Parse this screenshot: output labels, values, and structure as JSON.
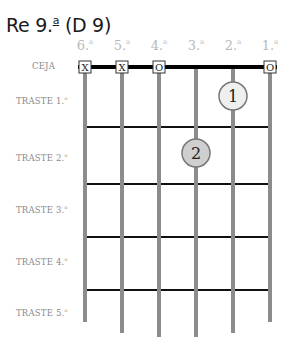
{
  "title": {
    "main": "Re 9.",
    "superscript": "a",
    "alt": "(D 9)"
  },
  "strings": [
    {
      "number": "6.",
      "sup": "a",
      "x": 85,
      "marker": "X",
      "bottom": 322
    },
    {
      "number": "5.",
      "sup": "a",
      "x": 122,
      "marker": "X",
      "bottom": 333
    },
    {
      "number": "4.",
      "sup": "a",
      "x": 159,
      "marker": "O",
      "bottom": 337
    },
    {
      "number": "3.",
      "sup": "a",
      "x": 196,
      "marker": "",
      "bottom": 337
    },
    {
      "number": "2.",
      "sup": "a",
      "x": 233,
      "marker": "",
      "bottom": 333
    },
    {
      "number": "1.",
      "sup": "a",
      "x": 270,
      "marker": "O",
      "bottom": 322
    }
  ],
  "row_labels": [
    {
      "text": "CEJA",
      "sup": "",
      "y": 67
    },
    {
      "text": "TRASTE 1.",
      "sup": "o",
      "y": 101
    },
    {
      "text": "TRASTE 2.",
      "sup": "o",
      "y": 158
    },
    {
      "text": "TRASTE 3.",
      "sup": "o",
      "y": 210
    },
    {
      "text": "TRASTE 4.",
      "sup": "o",
      "y": 262
    },
    {
      "text": "TRASTE 5.",
      "sup": "o",
      "y": 313
    }
  ],
  "frets_y": [
    127,
    184,
    237,
    290
  ],
  "nut_y": 67,
  "fingers": [
    {
      "label": "1",
      "string": 2,
      "fret": 1,
      "x": 233,
      "y": 96,
      "fill": "#efefef"
    },
    {
      "label": "2",
      "string": 3,
      "fret": 2,
      "x": 196,
      "y": 153,
      "fill": "#cfcfcf"
    }
  ],
  "colors": {
    "string": "#8c8c8c",
    "fret": "#111111",
    "nut": "#000000",
    "label": "#8a8a8a",
    "string_label": "#b8b8b8"
  }
}
